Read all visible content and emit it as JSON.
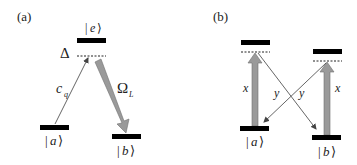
{
  "panels": {
    "a": {
      "label": "(a)",
      "levels": {
        "e": {
          "label_left": "|",
          "label_mid": "e",
          "label_right": "⟩"
        },
        "a": {
          "label_left": "|",
          "label_mid": "a",
          "label_right": "⟩"
        },
        "b": {
          "label_left": "|",
          "label_mid": "b",
          "label_right": "⟩"
        }
      },
      "detuning_label": "Δ",
      "probe_label_main": "c",
      "probe_label_sub": "q",
      "control_label_main": "Ω",
      "control_label_sub": "L"
    },
    "b": {
      "label": "(b)",
      "levels": {
        "a": {
          "label_left": "|",
          "label_mid": "a",
          "label_right": "⟩"
        },
        "b": {
          "label_left": "|",
          "label_mid": "b",
          "label_right": "⟩"
        }
      },
      "left_vertical_label": "x",
      "right_vertical_label": "x",
      "cross_left_label": "y",
      "cross_right_label": "y"
    }
  },
  "colors": {
    "level": "#000000",
    "thick_arrow": "#9a9a9a",
    "thick_arrow_edge": "#6e6e6e",
    "thin_arrow": "#555555",
    "text": "#222222"
  }
}
